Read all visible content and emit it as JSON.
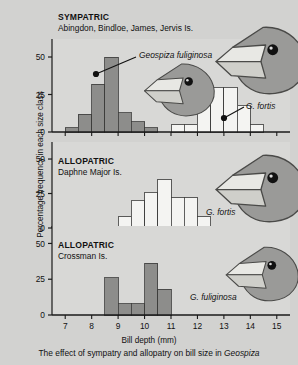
{
  "figure": {
    "caption_pre": "The effect of sympatry and allopatry on bill size in ",
    "caption_italic": "Geospiza",
    "x_axis_label": "Bill depth (mm)",
    "y_axis_label": "Percentage frequency in each size class",
    "x_ticks": [
      7,
      8,
      9,
      10,
      11,
      12,
      13,
      14,
      15
    ],
    "y_ticks": [
      0,
      25,
      50
    ],
    "colors": {
      "background": "#d2d2d0",
      "panel": "#d8d8d6",
      "gray_bars": "#8d8d8b",
      "white_bars": "#f4f4f2",
      "axis": "#1a1a1a",
      "bird_body": "#9a9a98",
      "bird_beak": "#e8e8e4",
      "bird_eye": "#111111"
    }
  },
  "panels": [
    {
      "id": "sympatric",
      "header": "SYMPATRIC",
      "locality": "Abingdon, Bindloe, James, Jervis Is.",
      "callouts": [
        {
          "id": "fuliginosa-callout",
          "text": "Geospiza fuliginosa",
          "italic": true
        },
        {
          "id": "fortis-callout",
          "text": "G. fortis",
          "italic": true
        }
      ],
      "birds": [
        "fuliginosa-head",
        "fortis-head"
      ]
    },
    {
      "id": "allopatric-daphne",
      "header": "ALLOPATRIC",
      "locality": "Daphne Major Is.",
      "callouts": [
        {
          "id": "fortis-callout",
          "text": "G. fortis",
          "italic": true
        }
      ],
      "birds": [
        "fortis-head"
      ]
    },
    {
      "id": "allopatric-crossman",
      "header": "ALLOPATRIC",
      "locality": "Crossman Is.",
      "callouts": [
        {
          "id": "fuliginosa-callout",
          "text": "G. fuliginosa",
          "italic": true
        }
      ],
      "birds": [
        "fuliginosa-head"
      ]
    }
  ],
  "chart_data": {
    "type": "bar",
    "title": "The effect of sympatry and allopatry on bill size in Geospiza",
    "xlabel": "Bill depth (mm)",
    "ylabel": "Percentage frequency in each size class",
    "xlim": [
      6.5,
      15.5
    ],
    "ylim": [
      0,
      58
    ],
    "bin_width": 0.5,
    "grid": false,
    "legend": "none",
    "panels": [
      {
        "name": "SYMPATRIC",
        "locality": "Abingdon, Bindloe, James, Jervis Is.",
        "series": [
          {
            "name": "Geospiza fuliginosa",
            "fill": "gray",
            "bins": [
              7.0,
              7.5,
              8.0,
              8.5,
              9.0,
              9.5,
              10.0
            ],
            "values": [
              3,
              12,
              32,
              50,
              13,
              7,
              3
            ]
          },
          {
            "name": "G. fortis",
            "fill": "white",
            "bins": [
              11.0,
              11.5,
              12.0,
              12.5,
              13.0,
              13.5,
              14.0
            ],
            "values": [
              5,
              5,
              18,
              30,
              30,
              18,
              5
            ]
          }
        ]
      },
      {
        "name": "ALLOPATRIC",
        "locality": "Daphne Major Is.",
        "series": [
          {
            "name": "G. fortis",
            "fill": "white",
            "bins": [
              9.0,
              9.5,
              10.0,
              10.5,
              11.0,
              11.5,
              12.0
            ],
            "values": [
              8,
              20,
              26,
              35,
              22,
              22,
              8
            ]
          }
        ]
      },
      {
        "name": "ALLOPATRIC",
        "locality": "Crossman Is.",
        "series": [
          {
            "name": "G. fuliginosa",
            "fill": "gray",
            "bins": [
              8.5,
              9.0,
              9.5,
              10.0,
              10.5,
              11.0
            ],
            "values": [
              26,
              8,
              8,
              36,
              18,
              0
            ]
          }
        ]
      }
    ]
  }
}
